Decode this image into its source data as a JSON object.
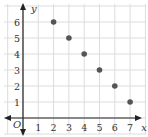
{
  "chart_data": {
    "type": "scatter",
    "title": "",
    "xlabel": "x",
    "ylabel": "y",
    "origin_label": "O",
    "x": [
      2,
      3,
      4,
      5,
      6,
      7
    ],
    "y": [
      6,
      5,
      4,
      3,
      2,
      1
    ],
    "points": [
      [
        2,
        6
      ],
      [
        3,
        5
      ],
      [
        4,
        4
      ],
      [
        5,
        3
      ],
      [
        6,
        2
      ],
      [
        7,
        1
      ]
    ],
    "xticks": [
      "1",
      "2",
      "3",
      "4",
      "5",
      "6",
      "7"
    ],
    "yticks": [
      "1",
      "2",
      "3",
      "4",
      "5",
      "6"
    ],
    "xlim": [
      0,
      7.6
    ],
    "ylim": [
      0,
      6.8
    ],
    "grid": true,
    "legend": null
  },
  "colors": {
    "grid": "#dcdcdc",
    "axis": "#222222",
    "point": "#555555",
    "text": "#333333"
  }
}
